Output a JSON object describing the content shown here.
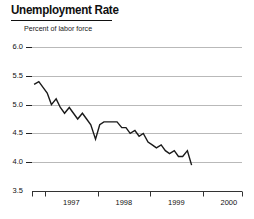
{
  "chart_data": {
    "type": "line",
    "title": "Unemployment Rate",
    "subtitle": "Percent of labor force",
    "xlabel": "",
    "ylabel": "",
    "ylim": [
      3.5,
      6.0
    ],
    "yticks": [
      6.0,
      5.5,
      5.0,
      4.5,
      4.0,
      3.5
    ],
    "ytick_labels": [
      "6.0",
      "5.5",
      "5.0",
      "4.5",
      "4.0",
      "3.5"
    ],
    "xlim": [
      1996.75,
      2000.75
    ],
    "xticks": [
      1997.0,
      1998.0,
      1999.0,
      2000.0
    ],
    "xtick_labels": [
      "1997",
      "1998",
      "1999",
      "2000"
    ],
    "grid": true,
    "grid_axis": "y",
    "legend": false,
    "line_color": "#1a1a1a",
    "series": [
      {
        "name": "Unemployment Rate",
        "x": [
          1996.79,
          1996.88,
          1996.96,
          1997.04,
          1997.12,
          1997.21,
          1997.29,
          1997.37,
          1997.46,
          1997.54,
          1997.62,
          1997.71,
          1997.79,
          1997.87,
          1997.96,
          1998.04,
          1998.12,
          1998.21,
          1998.29,
          1998.37,
          1998.46,
          1998.54,
          1998.62,
          1998.71,
          1998.79,
          1998.87,
          1998.96,
          1999.04,
          1999.12,
          1999.21,
          1999.29,
          1999.37,
          1999.46,
          1999.54,
          1999.62,
          1999.71,
          1999.79
        ],
        "values": [
          5.35,
          5.4,
          5.3,
          5.2,
          5.0,
          5.1,
          4.95,
          4.85,
          4.95,
          4.85,
          4.75,
          4.85,
          4.75,
          4.65,
          4.4,
          4.65,
          4.7,
          4.7,
          4.7,
          4.7,
          4.6,
          4.6,
          4.5,
          4.55,
          4.45,
          4.5,
          4.35,
          4.3,
          4.25,
          4.3,
          4.2,
          4.15,
          4.2,
          4.1,
          4.1,
          4.2,
          3.95
        ]
      }
    ]
  }
}
